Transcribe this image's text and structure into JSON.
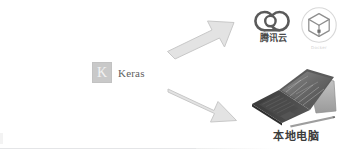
{
  "diagram": {
    "source_node": {
      "name": "Keras",
      "logo_letter": "K",
      "logo_box_color": "#c9c9c9",
      "label_color": "#5e5e5e"
    },
    "arrows": [
      {
        "id": "arrow-to-cloud",
        "direction": "up-right",
        "fill": "#e3e3e3",
        "stroke": "#c8c8c8"
      },
      {
        "id": "arrow-to-local",
        "direction": "down-right",
        "fill": "#e3e3e3",
        "stroke": "#c8c8c8"
      }
    ],
    "targets": [
      {
        "id": "tencent-cloud",
        "icon": "cloud-icon",
        "label": "腾讯云",
        "label_color": "#4a4a4a"
      },
      {
        "id": "box-circle",
        "icon": "cube-in-circle-icon",
        "label": "Docker",
        "label_color": "#d2d2d2"
      },
      {
        "id": "local-computer",
        "icon": "surface-laptop-icon",
        "label": "本地电脑",
        "label_color": "#3c3c3c"
      }
    ]
  },
  "colors": {
    "background": "#ffffff",
    "arrow_fill": "#e3e3e3",
    "arrow_stroke": "#c8c8c8",
    "rule": "#e4e5e7"
  }
}
